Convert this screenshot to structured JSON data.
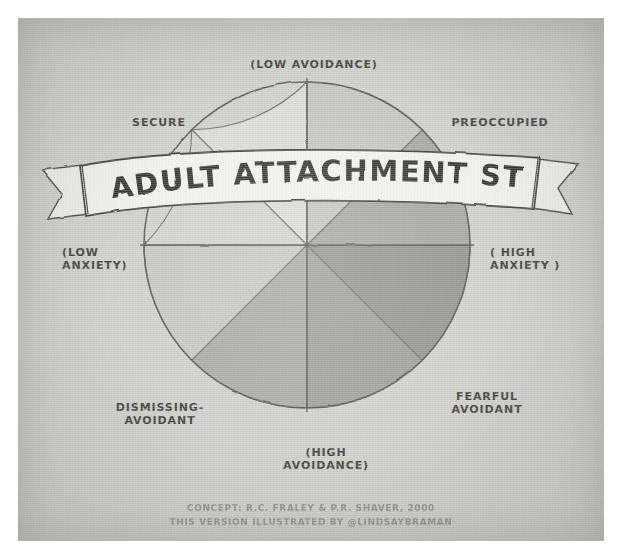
{
  "image": {
    "title": "ADULT ATTACHMENT STYLES",
    "medium": "hand-drawn scanned diagram"
  },
  "banner": {
    "title": "ADULT ATTACHMENT STYLES"
  },
  "axes": {
    "top": "(LOW AVOIDANCE)",
    "bottom": "(HIGH\nAVOIDANCE)",
    "left": "(LOW\nANXIETY)",
    "right": "( HIGH\nANXIETY )"
  },
  "styles": [
    {
      "name": "SECURE",
      "position": "upper-left",
      "fill": "#d4d4cf"
    },
    {
      "name": "PREOCCUPIED",
      "position": "upper-right",
      "fill": "#a9a9a2"
    },
    {
      "name": "FEARFUL\nAVOIDANT",
      "position": "lower-right",
      "fill": "#9d9d96"
    },
    {
      "name": "DISMISSING-\nAVOIDANT",
      "position": "lower-left",
      "fill": "#b6b6b0"
    }
  ],
  "wheel": {
    "type": "pie",
    "segment_count": 8,
    "segment_degrees": 45,
    "segments": [
      {
        "index": 0,
        "start_deg": 270,
        "end_deg": 315,
        "fill": "#d8d8d3",
        "quadrant": "upper-left"
      },
      {
        "index": 1,
        "start_deg": 315,
        "end_deg": 0,
        "fill": "#cfcfca",
        "quadrant": "upper-left"
      },
      {
        "index": 2,
        "start_deg": 0,
        "end_deg": 45,
        "fill": "#c4c4bd",
        "quadrant": "upper-right"
      },
      {
        "index": 3,
        "start_deg": 45,
        "end_deg": 90,
        "fill": "#a6a69f",
        "quadrant": "upper-right"
      },
      {
        "index": 4,
        "start_deg": 90,
        "end_deg": 135,
        "fill": "#9b9b94",
        "quadrant": "lower-right"
      },
      {
        "index": 5,
        "start_deg": 135,
        "end_deg": 180,
        "fill": "#909089",
        "quadrant": "lower-right"
      },
      {
        "index": 6,
        "start_deg": 180,
        "end_deg": 225,
        "fill": "#a3a39c",
        "quadrant": "lower-left"
      },
      {
        "index": 7,
        "start_deg": 225,
        "end_deg": 270,
        "fill": "#c2c2bb",
        "quadrant": "lower-left"
      }
    ],
    "center": {
      "x": 307,
      "y": 245
    },
    "radius": 165
  },
  "credits": {
    "line1": "CONCEPT: R.C. FRALEY & P.R. SHAVER, 2000",
    "line2": "THIS VERSION ILLUSTRATED BY @LINDSAYBRAMAN"
  },
  "colors": {
    "paper": "#cdcdc8",
    "ink": "#3a3a38",
    "credit_ink": "#8b8b86",
    "banner_fill": "#eeeeea"
  }
}
